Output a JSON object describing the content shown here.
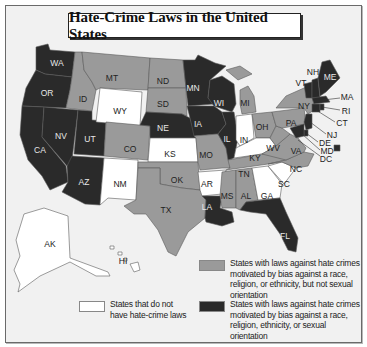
{
  "title": "Hate-Crime Laws in the United States",
  "colors": {
    "includes_sexual_orientation": "#2a2a2a",
    "excludes_sexual_orientation": "#9a9a9a",
    "no_laws": "#ffffff",
    "background": "#f1f1f1"
  },
  "legend": {
    "gray": "States with laws against hate crimes motivated by bias against a race, religion, or ethnicity, but not sexual orientation",
    "white": "States that do not have hate-crime laws",
    "dark": "States with laws against hate crimes motivated by bias against a race, religion, ethnicity, or sexual orientation"
  },
  "categories": {
    "includes_sexual_orientation": [
      "WA",
      "OR",
      "CA",
      "NV",
      "UT",
      "AZ",
      "MN",
      "WI",
      "IA",
      "IL",
      "NE",
      "LA",
      "FL",
      "ME",
      "NH",
      "VT",
      "MA",
      "RI",
      "CT",
      "NJ",
      "DE",
      "MD",
      "DC"
    ],
    "excludes_sexual_orientation": [
      "MT",
      "ID",
      "ND",
      "SD",
      "CO",
      "OK",
      "TX",
      "MO",
      "MI",
      "OH",
      "PA",
      "NY",
      "WV",
      "VA",
      "NC",
      "TN",
      "MS",
      "AL"
    ],
    "no_laws": [
      "WY",
      "NM",
      "KS",
      "AR",
      "IN",
      "KY",
      "GA",
      "SC",
      "AK",
      "HI"
    ]
  },
  "labels": {
    "WA": "WA",
    "OR": "OR",
    "CA": "CA",
    "NV": "NV",
    "UT": "UT",
    "AZ": "AZ",
    "ID": "ID",
    "MT": "MT",
    "WY": "WY",
    "CO": "CO",
    "NM": "NM",
    "ND": "ND",
    "SD": "SD",
    "NE": "NE",
    "KS": "KS",
    "OK": "OK",
    "TX": "TX",
    "MN": "MN",
    "IA": "IA",
    "MO": "MO",
    "AR": "AR",
    "LA": "LA",
    "WI": "WI",
    "IL": "IL",
    "MI": "MI",
    "IN": "IN",
    "OH": "OH",
    "KY": "KY",
    "TN": "TN",
    "MS": "MS",
    "AL": "AL",
    "GA": "GA",
    "FL": "FL",
    "SC": "SC",
    "NC": "NC",
    "VA": "VA",
    "WV": "WV",
    "PA": "PA",
    "NY": "NY",
    "VT": "VT",
    "NH": "NH",
    "ME": "ME",
    "MA": "MA",
    "RI": "RI",
    "CT": "CT",
    "NJ": "NJ",
    "DE": "DE",
    "MD": "MD",
    "DC": "DC",
    "AK": "AK",
    "HI": "HI"
  }
}
